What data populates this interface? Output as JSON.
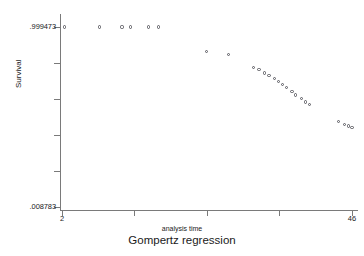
{
  "chart_data": {
    "type": "scatter",
    "title": "Gompertz regression",
    "xlabel": "analysis time",
    "ylabel": "Survival",
    "grid": false,
    "legend": null,
    "xlim": [
      2,
      46
    ],
    "ylim": [
      0.008783,
      0.999473
    ],
    "x_tick_labels": [
      "2",
      "46"
    ],
    "y_tick_labels": [
      ".999473",
      ".008783"
    ],
    "x_tick_count": 5,
    "y_tick_count": 6,
    "marker_style": "open-circle",
    "marker_color": "#58585f",
    "x": [
      2.4,
      7.7,
      11.1,
      12.4,
      15.1,
      16.6,
      23.9,
      27.3,
      31.1,
      31.9,
      32.7,
      33.4,
      34.2,
      34.9,
      35.5,
      36.1,
      36.9,
      37.4,
      38.3,
      38.9,
      39.6,
      44.0,
      44.9,
      45.5,
      46.0
    ],
    "y": [
      0.9995,
      0.9995,
      0.9995,
      0.9995,
      0.9995,
      0.9995,
      0.8635,
      0.8485,
      0.776,
      0.7665,
      0.7465,
      0.734,
      0.718,
      0.701,
      0.6845,
      0.6645,
      0.6425,
      0.6255,
      0.604,
      0.5865,
      0.5725,
      0.479,
      0.463,
      0.455,
      0.4475
    ],
    "points_px": [
      [
        63,
        27
      ],
      [
        91,
        27
      ],
      [
        108,
        27
      ],
      [
        116,
        27
      ],
      [
        124,
        27
      ],
      [
        132,
        27
      ],
      [
        175,
        26
      ],
      [
        176,
        27
      ],
      [
        177,
        28
      ],
      [
        202,
        26
      ],
      [
        206,
        27
      ]
    ]
  },
  "axes": {
    "y_top_label": ".999473",
    "y_bottom_label": ".008783",
    "x_left_label": "2",
    "x_right_label": "46",
    "y_title": "Survival",
    "x_title": "analysis time"
  },
  "title": "Gompertz regression"
}
